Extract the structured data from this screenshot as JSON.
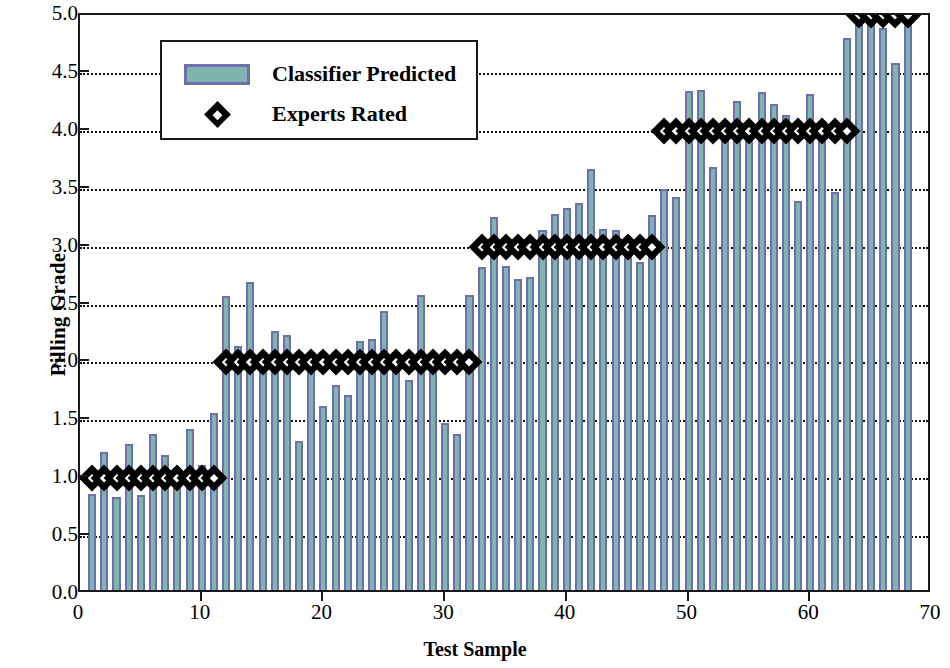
{
  "chart_data": {
    "type": "bar",
    "title": "",
    "xlabel": "Test Sample",
    "ylabel": "Pilling Grade",
    "xlim": [
      0,
      70
    ],
    "ylim": [
      0,
      5.0
    ],
    "xticks": [
      0,
      10,
      20,
      30,
      40,
      50,
      60,
      70
    ],
    "xtick_labels": [
      "0",
      "10",
      "20",
      "30",
      "40",
      "50",
      "60",
      "70"
    ],
    "yticks": [
      0.0,
      0.5,
      1.0,
      1.5,
      2.0,
      2.5,
      3.0,
      3.5,
      4.0,
      4.5,
      5.0
    ],
    "ytick_labels": [
      "0.0",
      "0.5",
      "1.0",
      "1.5",
      "2.0",
      "2.5",
      "3.0",
      "3.5",
      "4.0",
      "4.5",
      "5.0"
    ],
    "grid": true,
    "grid_style": "dotted-horizontal",
    "legend_position": "upper-left-inset",
    "bar_color": "#7fb5ae",
    "bar_edge_color": "#6e6fad",
    "marker_color": "#000000",
    "marker_fill": "#ffffff",
    "x": [
      1,
      2,
      3,
      4,
      5,
      6,
      7,
      8,
      9,
      10,
      11,
      12,
      13,
      14,
      15,
      16,
      17,
      18,
      19,
      20,
      21,
      22,
      23,
      24,
      25,
      26,
      27,
      28,
      29,
      30,
      31,
      32,
      33,
      34,
      35,
      36,
      37,
      38,
      39,
      40,
      41,
      42,
      43,
      44,
      45,
      46,
      47,
      48,
      49,
      50,
      51,
      52,
      53,
      54,
      55,
      56,
      57,
      58,
      59,
      60,
      61,
      62,
      63,
      64,
      65,
      66,
      67,
      68
    ],
    "series": [
      {
        "name": "Classifier Predicted",
        "type": "bar",
        "values": [
          0.83,
          1.19,
          0.8,
          1.26,
          0.82,
          1.35,
          1.17,
          1.05,
          1.39,
          1.08,
          1.53,
          2.54,
          2.11,
          2.66,
          1.91,
          2.24,
          2.2,
          1.29,
          2.05,
          1.59,
          1.77,
          1.68,
          2.15,
          2.17,
          2.41,
          1.98,
          1.81,
          2.55,
          1.9,
          1.44,
          1.35,
          2.55,
          2.79,
          3.22,
          2.8,
          2.69,
          2.7,
          3.11,
          3.25,
          3.3,
          3.34,
          3.64,
          3.12,
          3.11,
          2.95,
          2.83,
          3.24,
          3.46,
          3.39,
          4.31,
          4.32,
          3.65,
          4.0,
          4.22,
          3.95,
          4.3,
          4.2,
          4.1,
          3.36,
          4.28,
          3.92,
          3.44,
          4.77,
          5.0,
          5.0,
          4.85,
          4.55,
          5.0
        ]
      },
      {
        "name": "Experts Rated",
        "type": "scatter",
        "marker": "diamond",
        "values": [
          1,
          1,
          1,
          1,
          1,
          1,
          1,
          1,
          1,
          1,
          1,
          2,
          2,
          2,
          2,
          2,
          2,
          2,
          2,
          2,
          2,
          2,
          2,
          2,
          2,
          2,
          2,
          2,
          2,
          2,
          2,
          2,
          3,
          3,
          3,
          3,
          3,
          3,
          3,
          3,
          3,
          3,
          3,
          3,
          3,
          3,
          3,
          4,
          4,
          4,
          4,
          4,
          4,
          4,
          4,
          4,
          4,
          4,
          4,
          4,
          4,
          4,
          4,
          5,
          5,
          5,
          5,
          5
        ]
      }
    ]
  },
  "legend": {
    "items": [
      {
        "label": "Classifier Predicted",
        "key": "bar-swatch"
      },
      {
        "label": "Experts Rated",
        "key": "diamond-marker"
      }
    ]
  }
}
